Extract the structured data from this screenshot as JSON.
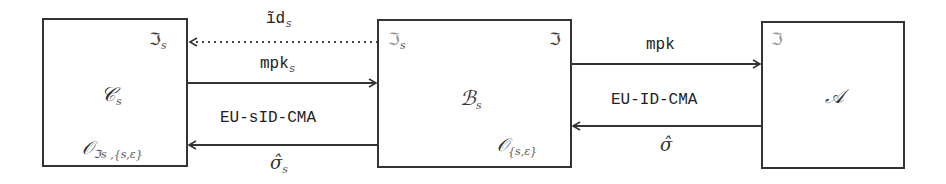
{
  "diagram": {
    "nodes": [
      {
        "id": "C_s",
        "label": "𝒞",
        "sub": "s",
        "top_right": {
          "label": "ℑ",
          "sub": "s"
        },
        "bottom_right": {
          "label": "𝒪",
          "sub": "ℑs ,{s,ε}"
        }
      },
      {
        "id": "B_s",
        "label": "ℬ",
        "sub": "s",
        "top_left": {
          "label": "ℑ",
          "sub": "s"
        },
        "top_right": {
          "label": "ℑ"
        },
        "bottom_right": {
          "label": "𝒪",
          "sub": "{s,ε}"
        }
      },
      {
        "id": "A",
        "label": "𝒜",
        "top_left": {
          "label": "ℑ"
        }
      }
    ],
    "edges": [
      {
        "from": "B_s",
        "to": "C_s",
        "style": "dotted",
        "label": "ĩd",
        "label_sub": "s"
      },
      {
        "from": "C_s",
        "to": "B_s",
        "style": "solid",
        "label": "mpk",
        "label_sub": "s"
      },
      {
        "from": "B_s",
        "to": "C_s",
        "style": "solid",
        "label_above": "EU-sID-CMA",
        "label_below": "σ̂",
        "label_below_sub": "s"
      },
      {
        "from": "B_s",
        "to": "A",
        "style": "solid",
        "label": "mpk"
      },
      {
        "from": "A",
        "to": "B_s",
        "style": "solid",
        "label_above": "EU-ID-CMA",
        "label_below": "σ̂"
      }
    ]
  }
}
